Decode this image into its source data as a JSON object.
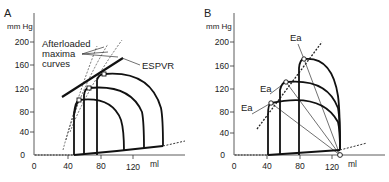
{
  "panels": [
    {
      "id": "A",
      "letter": "A",
      "y_unit": "mm Hg",
      "x_unit": "ml",
      "y_ticks": [
        "200",
        "160",
        "120",
        "80",
        "40",
        "0"
      ],
      "x_ticks": [
        "0",
        "40",
        "80",
        "120"
      ],
      "annotations": {
        "afterloaded_1": "Afterloaded",
        "afterloaded_2": "maxima",
        "afterloaded_3": "curves",
        "espvr": "ESPVR"
      }
    },
    {
      "id": "B",
      "letter": "B",
      "y_unit": "mm Hg",
      "x_unit": "ml",
      "y_ticks": [
        "200",
        "160",
        "120",
        "80",
        "40",
        "0"
      ],
      "x_ticks": [
        "0",
        "40",
        "80",
        "120"
      ],
      "annotations": {
        "ea_1": "Ea",
        "ea_2": "Ea",
        "ea_3": "Ea"
      }
    }
  ],
  "colors": {
    "ink": "#1a1a1a",
    "background": "#ffffff"
  }
}
